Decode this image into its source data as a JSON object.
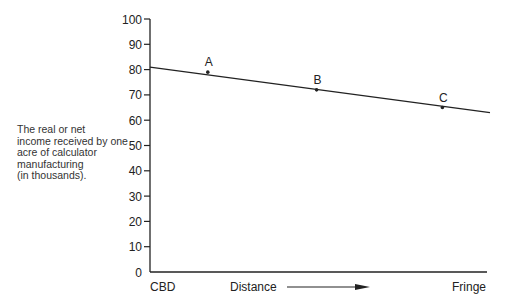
{
  "chart_data": {
    "type": "line",
    "title": "",
    "ylabel_lines": [
      "The real or net",
      "income received by one",
      "acre of calculator",
      "manufacturing",
      "(in thousands)."
    ],
    "xlabel": "Distance",
    "x_start_label": "CBD",
    "x_end_label": "Fringe",
    "yticks": [
      0,
      10,
      20,
      30,
      40,
      50,
      60,
      70,
      80,
      90,
      100
    ],
    "ylim": [
      0,
      100
    ],
    "grid": false,
    "series": [
      {
        "name": "Bid-rent line",
        "x": [
          0,
          1
        ],
        "values": [
          81,
          63
        ]
      }
    ],
    "points": [
      {
        "label": "A",
        "x": 0.17,
        "y": 79
      },
      {
        "label": "B",
        "x": 0.49,
        "y": 72
      },
      {
        "label": "C",
        "x": 0.86,
        "y": 65
      }
    ]
  },
  "colors": {
    "line": "#222222",
    "text": "#222222"
  }
}
